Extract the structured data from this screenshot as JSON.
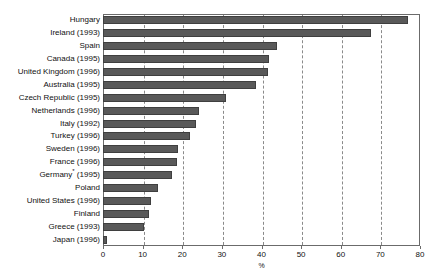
{
  "chart_data": {
    "type": "bar",
    "orientation": "horizontal",
    "title": "",
    "xlabel": "%",
    "ylabel": "",
    "xlim": [
      0,
      80
    ],
    "xticks": [
      0,
      10,
      20,
      30,
      40,
      50,
      60,
      70,
      80
    ],
    "grid": true,
    "legend": null,
    "categories": [
      "Hungary",
      "Ireland (1993)",
      "Spain",
      "Canada (1995)",
      "United Kingdom (1996)",
      "Australia (1995)",
      "Czech Republic (1995)",
      "Netherlands (1996)",
      "Italy (1992)",
      "Turkey (1996)",
      "Sweden (1996)",
      "France (1996)",
      "Germany* (1995)",
      "Poland",
      "United States (1996)",
      "Finland",
      "Greece (1993)",
      "Japan (1996)"
    ],
    "values": [
      77,
      67.7,
      44,
      42,
      41.6,
      38.5,
      31,
      24.3,
      23.5,
      22,
      19,
      18.7,
      17.5,
      14,
      12,
      11.7,
      10.3,
      1
    ]
  },
  "style": {
    "bar_color": "#595959",
    "bar_edge_color": "#3f3f3f",
    "frame_color": "#6b6b6b",
    "grid_color": "#8a8a8a",
    "background": "#ffffff",
    "text_color": "#111111"
  },
  "footnote_marker": "*"
}
